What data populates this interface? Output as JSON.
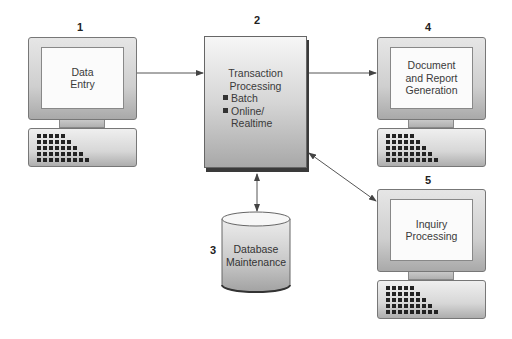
{
  "diagram": {
    "type": "transaction-processing-system-flow",
    "nodes": [
      {
        "id": "1",
        "number": "1",
        "shape": "computer",
        "lines": [
          "Data",
          "Entry"
        ]
      },
      {
        "id": "2",
        "number": "2",
        "shape": "box",
        "title_lines": [
          "Transaction",
          "Processing"
        ],
        "bullets": [
          {
            "lines": [
              "Batch"
            ]
          },
          {
            "lines": [
              "Online/",
              "Realtime"
            ]
          }
        ]
      },
      {
        "id": "3",
        "number": "3",
        "shape": "cylinder",
        "lines": [
          "Database",
          "Maintenance"
        ]
      },
      {
        "id": "4",
        "number": "4",
        "shape": "computer",
        "lines": [
          "Document",
          "and Report",
          "Generation"
        ]
      },
      {
        "id": "5",
        "number": "5",
        "shape": "computer",
        "lines": [
          "Inquiry",
          "Processing"
        ]
      }
    ],
    "edges": [
      {
        "from": "1",
        "to": "2",
        "direction": "one-way"
      },
      {
        "from": "2",
        "to": "4",
        "direction": "one-way"
      },
      {
        "from": "2",
        "to": "3",
        "direction": "two-way"
      },
      {
        "from": "2",
        "to": "5",
        "direction": "two-way"
      }
    ],
    "colors": {
      "line": "#555555",
      "text": "#333333",
      "shadow": "#3a3a3a"
    }
  },
  "icons": {
    "bullet": "square-bullet-icon",
    "keyboard": "keyboard-icon",
    "monitor": "monitor-icon",
    "database": "database-cylinder-icon"
  }
}
